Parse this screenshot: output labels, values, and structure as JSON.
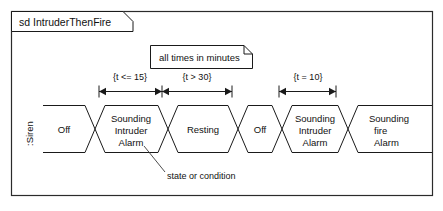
{
  "frame": {
    "label": "sd IntruderThenFire",
    "kind": "sequence-diagram-frame"
  },
  "note": {
    "text": "all times in minutes"
  },
  "lifeline": {
    "label": ":Siren"
  },
  "annotation": {
    "text": "state or condition"
  },
  "constraints": [
    {
      "label": "{t <= 15}"
    },
    {
      "label": "{t > 30}"
    },
    {
      "label": "{t = 10}"
    }
  ],
  "states": [
    {
      "lines": [
        "Off"
      ]
    },
    {
      "lines": [
        "Sounding",
        "Intruder",
        "Alarm"
      ]
    },
    {
      "lines": [
        "Resting"
      ]
    },
    {
      "lines": [
        "Off"
      ]
    },
    {
      "lines": [
        "Sounding",
        "Intruder",
        "Alarm"
      ]
    },
    {
      "lines": [
        "Sounding",
        "fire",
        "Alarm"
      ]
    }
  ],
  "colors": {
    "ink": "#111111",
    "line": "#1a1a1a",
    "frame": "#2b2b2b",
    "paper": "#ffffff"
  }
}
